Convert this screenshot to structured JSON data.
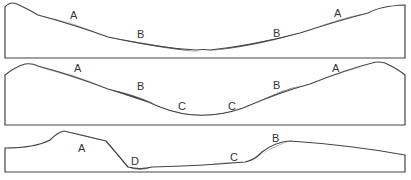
{
  "diagram": {
    "type": "valley cross-section profiles",
    "colors": {
      "outline": "#444444",
      "zone_A": "#c4c4c4",
      "zone_B": "#6a6a6a",
      "zone_C": "#c8c8c8",
      "zone_D": "#888888"
    },
    "panels": [
      {
        "id": "panel-1",
        "labels": [
          {
            "text": "A",
            "x": 70,
            "y": 19
          },
          {
            "text": "B",
            "x": 137,
            "y": 38
          },
          {
            "text": "B",
            "x": 273,
            "y": 37
          },
          {
            "text": "A",
            "x": 334,
            "y": 17
          }
        ]
      },
      {
        "id": "panel-2",
        "labels": [
          {
            "text": "A",
            "x": 74,
            "y": 72
          },
          {
            "text": "B",
            "x": 137,
            "y": 90
          },
          {
            "text": "C",
            "x": 182,
            "y": 110
          },
          {
            "text": "C",
            "x": 232,
            "y": 110
          },
          {
            "text": "B",
            "x": 275,
            "y": 89
          },
          {
            "text": "A",
            "x": 334,
            "y": 72
          }
        ]
      },
      {
        "id": "panel-3",
        "labels": [
          {
            "text": "A",
            "x": 80,
            "y": 152
          },
          {
            "text": "D",
            "x": 134,
            "y": 166
          },
          {
            "text": "C",
            "x": 233,
            "y": 161
          },
          {
            "text": "B",
            "x": 275,
            "y": 141
          }
        ]
      }
    ]
  }
}
